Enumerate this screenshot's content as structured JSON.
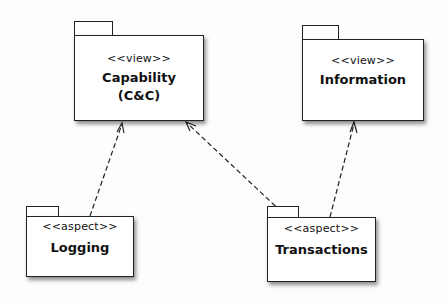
{
  "diagram": {
    "type": "uml-package-dependency",
    "packages": [
      {
        "id": "capability",
        "stereotype": "<<view>>",
        "name_lines": [
          "Capability",
          "(C&C)"
        ]
      },
      {
        "id": "information",
        "stereotype": "<<view>>",
        "name_lines": [
          "Information"
        ]
      },
      {
        "id": "logging",
        "stereotype": "<<aspect>>",
        "name_lines": [
          "Logging"
        ]
      },
      {
        "id": "transactions",
        "stereotype": "<<aspect>>",
        "name_lines": [
          "Transactions"
        ]
      }
    ],
    "dependencies": [
      {
        "from": "logging",
        "to": "capability",
        "style": "dashed-open-arrow"
      },
      {
        "from": "transactions",
        "to": "capability",
        "style": "dashed-open-arrow"
      },
      {
        "from": "transactions",
        "to": "information",
        "style": "dashed-open-arrow"
      }
    ],
    "colors": {
      "line": "#222222",
      "fill": "#ffffff",
      "background": "#fdfdfc"
    }
  }
}
